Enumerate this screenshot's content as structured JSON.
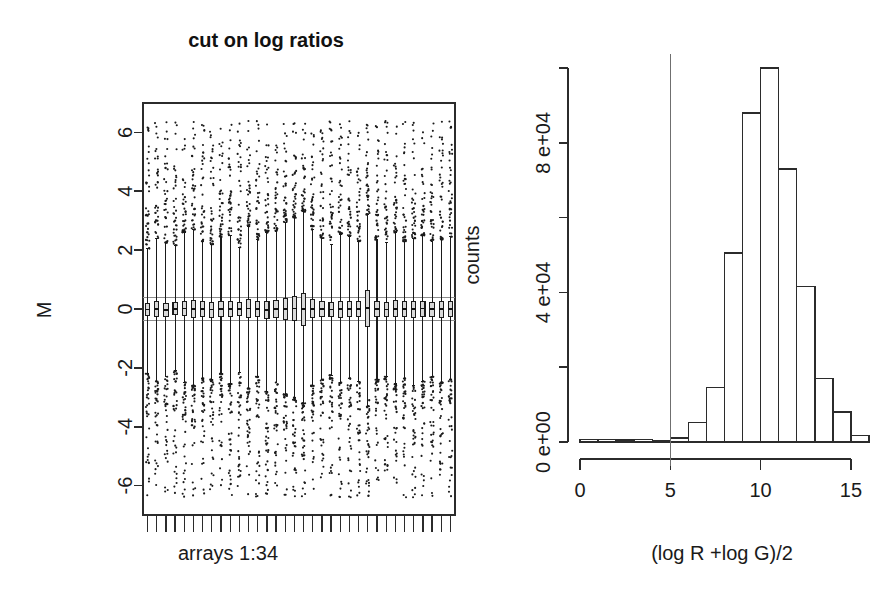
{
  "figure": {
    "title": "cut on log ratios",
    "width": 896,
    "height": 607
  },
  "chart_data": [
    {
      "id": "boxplot-panel",
      "type": "boxplot",
      "title": "cut on log ratios",
      "xlabel": "arrays 1:34",
      "ylabel": "M",
      "ylim": [
        -7,
        7
      ],
      "ytick_values": [
        6,
        4,
        2,
        0,
        -2,
        -4,
        -6
      ],
      "ytick_labels": [
        "6",
        "4",
        "2",
        "0",
        "-2",
        "-4",
        "-6"
      ],
      "xtick_count": 34,
      "xtick_labels": [],
      "grid": false,
      "reference_lines": [
        0.38,
        -0.38
      ],
      "n_arrays": 34,
      "boxes": [
        {
          "array": 1,
          "median": -0.02,
          "q1": -0.22,
          "q3": 0.18,
          "lower": -2.2,
          "upper": 2.05,
          "outliers": [
            2.6,
            2.9,
            -2.7,
            3.2,
            -3.0
          ]
        },
        {
          "array": 2,
          "median": 0.01,
          "q1": -0.24,
          "q3": 0.26,
          "lower": -2.45,
          "upper": 2.4,
          "outliers": [
            3.0,
            -3.1,
            3.5,
            -2.9
          ]
        },
        {
          "array": 3,
          "median": -0.03,
          "q1": -0.25,
          "q3": 0.2,
          "lower": -2.3,
          "upper": 2.25,
          "outliers": [
            2.8,
            -3.3,
            3.1
          ]
        },
        {
          "array": 4,
          "median": 0.0,
          "q1": -0.2,
          "q3": 0.21,
          "lower": -2.1,
          "upper": 2.15,
          "outliers": [
            2.7,
            -2.8,
            3.0,
            -3.4
          ]
        },
        {
          "array": 5,
          "median": 0.02,
          "q1": -0.23,
          "q3": 0.27,
          "lower": -2.5,
          "upper": 2.6,
          "outliers": [
            3.3,
            -3.0,
            3.8,
            -3.6
          ]
        },
        {
          "array": 6,
          "median": -0.01,
          "q1": -0.3,
          "q3": 0.28,
          "lower": -2.6,
          "upper": 2.7,
          "outliers": [
            3.4,
            4.2,
            -3.5,
            -4.0,
            5.2
          ]
        },
        {
          "array": 7,
          "median": 0.0,
          "q1": -0.26,
          "q3": 0.24,
          "lower": -2.35,
          "upper": 2.3,
          "outliers": [
            2.9,
            -3.2,
            3.3
          ]
        },
        {
          "array": 8,
          "median": -0.02,
          "q1": -0.28,
          "q3": 0.22,
          "lower": -2.4,
          "upper": 2.2,
          "outliers": [
            3.0,
            -3.6,
            2.8,
            -4.4
          ]
        },
        {
          "array": 9,
          "median": 0.01,
          "q1": -0.24,
          "q3": 0.25,
          "lower": -2.2,
          "upper": 2.45,
          "outliers": [
            3.1,
            -2.9,
            3.6
          ]
        },
        {
          "array": 10,
          "median": 0.0,
          "q1": -0.27,
          "q3": 0.26,
          "lower": -2.55,
          "upper": 2.5,
          "outliers": [
            3.2,
            -3.4,
            4.0,
            -4.6
          ]
        },
        {
          "array": 11,
          "median": -0.01,
          "q1": -0.22,
          "q3": 0.21,
          "lower": -2.15,
          "upper": 2.1,
          "outliers": [
            2.7,
            -3.0,
            3.0
          ]
        },
        {
          "array": 12,
          "median": 0.02,
          "q1": -0.3,
          "q3": 0.32,
          "lower": -2.7,
          "upper": 2.8,
          "outliers": [
            3.5,
            -3.8,
            4.1,
            -4.2
          ]
        },
        {
          "array": 13,
          "median": 0.0,
          "q1": -0.25,
          "q3": 0.24,
          "lower": -2.3,
          "upper": 2.35,
          "outliers": [
            3.0,
            -3.1,
            3.4
          ]
        },
        {
          "array": 14,
          "median": -0.03,
          "q1": -0.33,
          "q3": 0.27,
          "lower": -2.8,
          "upper": 2.6,
          "outliers": [
            3.3,
            -3.9,
            3.9,
            -4.8
          ]
        },
        {
          "array": 15,
          "median": 0.01,
          "q1": -0.28,
          "q3": 0.3,
          "lower": -2.5,
          "upper": 2.65,
          "outliers": [
            3.4,
            -3.3,
            4.3
          ]
        },
        {
          "array": 16,
          "median": 0.0,
          "q1": -0.35,
          "q3": 0.36,
          "lower": -2.9,
          "upper": 2.95,
          "outliers": [
            3.6,
            -3.7,
            4.5,
            -4.1
          ]
        },
        {
          "array": 17,
          "median": 0.02,
          "q1": -0.4,
          "q3": 0.42,
          "lower": -3.0,
          "upper": 3.1,
          "outliers": [
            3.9,
            -4.2,
            4.6,
            -4.9
          ]
        },
        {
          "array": 18,
          "median": -0.01,
          "q1": -0.55,
          "q3": 0.52,
          "lower": -3.2,
          "upper": 3.3,
          "outliers": [
            4.0,
            -4.4,
            4.8,
            -5.1
          ]
        },
        {
          "array": 19,
          "median": 0.01,
          "q1": -0.3,
          "q3": 0.31,
          "lower": -2.6,
          "upper": 2.7,
          "outliers": [
            3.2,
            -3.5,
            3.8
          ]
        },
        {
          "array": 20,
          "median": 0.0,
          "q1": -0.26,
          "q3": 0.25,
          "lower": -2.4,
          "upper": 2.4,
          "outliers": [
            3.0,
            -3.2,
            3.5
          ]
        },
        {
          "array": 21,
          "median": -0.02,
          "q1": -0.24,
          "q3": 0.22,
          "lower": -2.25,
          "upper": 2.2,
          "outliers": [
            2.8,
            -3.0,
            3.2
          ]
        },
        {
          "array": 22,
          "median": 0.01,
          "q1": -0.28,
          "q3": 0.27,
          "lower": -2.5,
          "upper": 2.55,
          "outliers": [
            3.3,
            -3.6,
            3.7
          ]
        },
        {
          "array": 23,
          "median": 0.0,
          "q1": -0.25,
          "q3": 0.26,
          "lower": -2.35,
          "upper": 2.45,
          "outliers": [
            3.1,
            -3.3,
            3.4
          ]
        },
        {
          "array": 24,
          "median": -0.01,
          "q1": -0.27,
          "q3": 0.24,
          "lower": -2.45,
          "upper": 2.3,
          "outliers": [
            3.0,
            -3.4,
            3.3
          ]
        },
        {
          "array": 25,
          "median": 0.03,
          "q1": -0.6,
          "q3": 0.62,
          "lower": -3.3,
          "upper": 3.2,
          "outliers": [
            3.8,
            -3.9,
            4.2,
            -3.1
          ]
        },
        {
          "array": 26,
          "median": 0.0,
          "q1": -0.26,
          "q3": 0.25,
          "lower": -2.4,
          "upper": 2.35,
          "outliers": [
            3.0,
            -3.2,
            3.3
          ]
        },
        {
          "array": 27,
          "median": -0.02,
          "q1": -0.24,
          "q3": 0.23,
          "lower": -2.3,
          "upper": 2.25,
          "outliers": [
            2.9,
            -3.1,
            3.1
          ]
        },
        {
          "array": 28,
          "median": 0.01,
          "q1": -0.27,
          "q3": 0.28,
          "lower": -2.55,
          "upper": 2.6,
          "outliers": [
            3.2,
            -3.5,
            3.6
          ]
        },
        {
          "array": 29,
          "median": 0.0,
          "q1": -0.25,
          "q3": 0.24,
          "lower": -2.35,
          "upper": 2.3,
          "outliers": [
            3.0,
            -3.2,
            3.2
          ]
        },
        {
          "array": 30,
          "median": -0.01,
          "q1": -0.29,
          "q3": 0.26,
          "lower": -2.6,
          "upper": 2.4,
          "outliers": [
            3.1,
            -3.6,
            3.4
          ]
        },
        {
          "array": 31,
          "median": 0.02,
          "q1": -0.26,
          "q3": 0.27,
          "lower": -2.45,
          "upper": 2.5,
          "outliers": [
            3.2,
            -3.3,
            3.5
          ]
        },
        {
          "array": 32,
          "median": 0.0,
          "q1": -0.24,
          "q3": 0.23,
          "lower": -2.3,
          "upper": 2.3,
          "outliers": [
            2.9,
            -3.1,
            3.3
          ]
        },
        {
          "array": 33,
          "median": -0.01,
          "q1": -0.28,
          "q3": 0.25,
          "lower": -2.5,
          "upper": 2.35,
          "outliers": [
            3.1,
            -3.4,
            3.2
          ]
        },
        {
          "array": 34,
          "median": 0.01,
          "q1": -0.25,
          "q3": 0.26,
          "lower": -2.4,
          "upper": 2.45,
          "outliers": [
            3.0,
            -3.2,
            3.4
          ]
        }
      ]
    },
    {
      "id": "histogram-panel",
      "type": "bar",
      "subtype": "histogram",
      "xlabel": "(log R +log G)/2",
      "ylabel": "counts",
      "xlim": [
        0,
        16
      ],
      "ylim": [
        0,
        100000
      ],
      "xtick_values": [
        0,
        5,
        10,
        15
      ],
      "xtick_labels": [
        "0",
        "5",
        "10",
        "15"
      ],
      "ytick_values": [
        0,
        20000,
        40000,
        60000,
        80000,
        100000
      ],
      "ytick_labels": [
        "0 e+00",
        "",
        "4 e+04",
        "",
        "8 e+04",
        ""
      ],
      "grid": false,
      "bin_width": 1,
      "bin_starts": [
        0,
        1,
        2,
        3,
        4,
        5,
        6,
        7,
        8,
        9,
        10,
        11,
        12,
        13,
        14,
        15
      ],
      "values": [
        700,
        600,
        500,
        600,
        400,
        1100,
        5200,
        14500,
        50500,
        88000,
        100000,
        73000,
        41500,
        17000,
        8000,
        1700
      ],
      "cut_line": {
        "x": 5,
        "label": "cut threshold"
      }
    }
  ]
}
